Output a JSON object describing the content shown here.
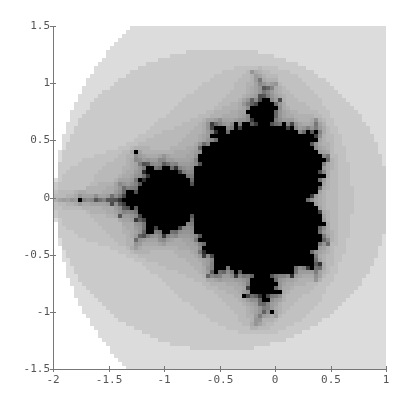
{
  "chart_data": {
    "type": "heatmap",
    "title": "",
    "xlabel": "",
    "ylabel": "",
    "xlim": [
      -2,
      1
    ],
    "ylim": [
      -1.5,
      1.5
    ],
    "x_ticks": [
      "-2",
      "-1.5",
      "-1",
      "-0.5",
      "0",
      "0.5",
      "1"
    ],
    "y_ticks": [
      "1.5",
      "1",
      "0.5",
      "0",
      "-0.5",
      "-1",
      "-1.5"
    ],
    "x_tick_values": [
      -2,
      -1.5,
      -1,
      -0.5,
      0,
      0.5,
      1
    ],
    "y_tick_values": [
      1.5,
      1,
      0.5,
      0,
      -0.5,
      -1,
      -1.5
    ],
    "grid": false,
    "legend": null,
    "render": {
      "max_iterations": 30,
      "escape_radius": 2,
      "inside_color": "#000000",
      "outside_color": "#ffffff",
      "resolution_px": 4
    }
  },
  "layout": {
    "origin_px": [
      53,
      369
    ],
    "x_end_px": 386,
    "y_end_px": 26,
    "axis_color": "#777777"
  }
}
